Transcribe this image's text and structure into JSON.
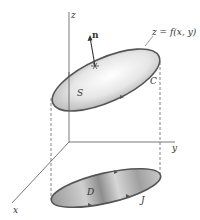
{
  "diagram": {
    "labels": {
      "z_axis": "z",
      "y_axis": "y",
      "x_axis": "x",
      "normal": "n",
      "surface_eq": "z = f(x, y)",
      "surface": "S",
      "curve": "C",
      "region": "D",
      "boundary": "J"
    },
    "colors": {
      "line": "#555555",
      "surface_light": "#f4f4f4",
      "surface_dark": "#b8b8b8",
      "region_light": "#d8d8d8",
      "region_dark": "#8a8a8a",
      "curve": "#5a5a5a"
    }
  }
}
